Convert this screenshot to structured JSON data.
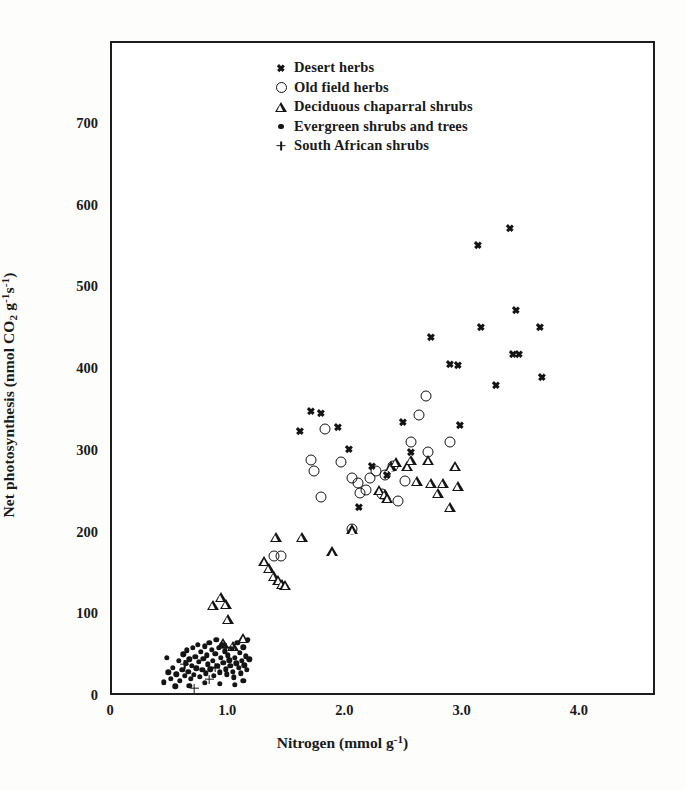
{
  "figure": {
    "background_color": "#fdfdfc",
    "ink_color": "#141414"
  },
  "axes": {
    "x_title_prefix": "Nitrogen (mmol g",
    "x_title_sup": "-1",
    "x_title_suffix": ")",
    "y_title_part1": "Net photosynthesis (nmol CO",
    "y_title_sub": "2",
    "y_title_part2": " g",
    "y_title_sup1": "-1",
    "y_title_part3": "s",
    "y_title_sup2": "-1",
    "y_title_part4": ")",
    "x_ticks": [
      "0",
      "1.0",
      "2.0",
      "3.0",
      "4.0"
    ],
    "x_tick_values": [
      0,
      1.0,
      2.0,
      3.0,
      4.0
    ],
    "y_ticks": [
      "0",
      "100",
      "200",
      "300",
      "400",
      "500",
      "600",
      "700"
    ],
    "y_tick_values": [
      0,
      100,
      200,
      300,
      400,
      500,
      600,
      700
    ]
  },
  "legend": {
    "position": "top-center",
    "entries": [
      {
        "marker": "x-marker",
        "label": "Desert herbs"
      },
      {
        "marker": "circle-marker",
        "label": "Old field herbs"
      },
      {
        "marker": "triangle-marker",
        "label": "Deciduous chaparral shrubs"
      },
      {
        "marker": "dot-marker",
        "label": "Evergreen shrubs and trees"
      },
      {
        "marker": "plus-marker",
        "label": "South African shrubs"
      }
    ]
  },
  "chart_data": {
    "type": "scatter",
    "title": "",
    "xlabel": "Nitrogen (mmol g-1)",
    "ylabel": "Net photosynthesis (nmol CO2 g-1 s-1)",
    "xlim": [
      0,
      4.65
    ],
    "ylim": [
      0,
      800
    ],
    "grid": false,
    "legend_position": "top-center",
    "series": [
      {
        "name": "Desert herbs",
        "marker": "x",
        "points": [
          [
            1.7,
            350
          ],
          [
            1.78,
            348
          ],
          [
            1.93,
            330
          ],
          [
            2.02,
            303
          ],
          [
            2.22,
            283
          ],
          [
            2.11,
            232
          ],
          [
            2.48,
            337
          ],
          [
            2.55,
            300
          ],
          [
            2.72,
            440
          ],
          [
            2.88,
            407
          ],
          [
            2.95,
            406
          ],
          [
            2.97,
            333
          ],
          [
            3.12,
            553
          ],
          [
            3.15,
            453
          ],
          [
            3.4,
            574
          ],
          [
            3.42,
            420
          ],
          [
            3.45,
            474
          ],
          [
            3.47,
            420
          ],
          [
            3.28,
            382
          ],
          [
            3.65,
            452
          ],
          [
            3.67,
            392
          ],
          [
            1.6,
            325
          ],
          [
            2.35,
            272
          ]
        ]
      },
      {
        "name": "Old field herbs",
        "marker": "circle",
        "points": [
          [
            1.44,
            172
          ],
          [
            1.7,
            290
          ],
          [
            1.72,
            277
          ],
          [
            1.78,
            245
          ],
          [
            1.82,
            328
          ],
          [
            1.95,
            287
          ],
          [
            2.05,
            268
          ],
          [
            2.1,
            262
          ],
          [
            2.12,
            250
          ],
          [
            2.17,
            253
          ],
          [
            2.2,
            268
          ],
          [
            2.25,
            276
          ],
          [
            2.33,
            272
          ],
          [
            2.4,
            282
          ],
          [
            2.44,
            240
          ],
          [
            2.5,
            264
          ],
          [
            2.55,
            312
          ],
          [
            2.62,
            345
          ],
          [
            2.68,
            368
          ],
          [
            2.7,
            300
          ],
          [
            2.88,
            312
          ],
          [
            1.38,
            172
          ],
          [
            2.3,
            248
          ],
          [
            2.05,
            205
          ]
        ]
      },
      {
        "name": "Deciduous chaparral shrubs",
        "marker": "triangle",
        "points": [
          [
            0.86,
            113
          ],
          [
            0.93,
            122
          ],
          [
            0.97,
            114
          ],
          [
            0.99,
            95
          ],
          [
            0.95,
            66
          ],
          [
            1.03,
            62
          ],
          [
            1.3,
            166
          ],
          [
            1.34,
            158
          ],
          [
            1.38,
            148
          ],
          [
            1.42,
            143
          ],
          [
            1.45,
            138
          ],
          [
            1.4,
            196
          ],
          [
            1.48,
            137
          ],
          [
            1.62,
            196
          ],
          [
            1.88,
            178
          ],
          [
            2.05,
            205
          ],
          [
            2.28,
            253
          ],
          [
            2.33,
            248
          ],
          [
            2.38,
            282
          ],
          [
            2.42,
            288
          ],
          [
            2.52,
            283
          ],
          [
            2.55,
            290
          ],
          [
            2.6,
            264
          ],
          [
            2.7,
            290
          ],
          [
            2.72,
            262
          ],
          [
            2.78,
            250
          ],
          [
            2.82,
            262
          ],
          [
            2.88,
            232
          ],
          [
            2.93,
            283
          ],
          [
            2.95,
            258
          ],
          [
            2.35,
            243
          ],
          [
            1.12,
            72
          ]
        ]
      },
      {
        "name": "Evergreen shrubs and trees",
        "marker": "dot",
        "points": [
          [
            0.44,
            18
          ],
          [
            0.5,
            22
          ],
          [
            0.52,
            36
          ],
          [
            0.55,
            28
          ],
          [
            0.57,
            44
          ],
          [
            0.58,
            20
          ],
          [
            0.6,
            33
          ],
          [
            0.61,
            52
          ],
          [
            0.62,
            26
          ],
          [
            0.63,
            41
          ],
          [
            0.64,
            57
          ],
          [
            0.65,
            31
          ],
          [
            0.66,
            46
          ],
          [
            0.67,
            22
          ],
          [
            0.68,
            38
          ],
          [
            0.69,
            60
          ],
          [
            0.7,
            27
          ],
          [
            0.71,
            49
          ],
          [
            0.72,
            35
          ],
          [
            0.73,
            64
          ],
          [
            0.74,
            43
          ],
          [
            0.75,
            25
          ],
          [
            0.76,
            55
          ],
          [
            0.77,
            33
          ],
          [
            0.78,
            47
          ],
          [
            0.79,
            62
          ],
          [
            0.8,
            29
          ],
          [
            0.81,
            51
          ],
          [
            0.82,
            40
          ],
          [
            0.83,
            66
          ],
          [
            0.84,
            34
          ],
          [
            0.85,
            58
          ],
          [
            0.86,
            44
          ],
          [
            0.87,
            26
          ],
          [
            0.88,
            53
          ],
          [
            0.89,
            70
          ],
          [
            0.9,
            38
          ],
          [
            0.91,
            60
          ],
          [
            0.92,
            30
          ],
          [
            0.93,
            48
          ],
          [
            0.94,
            64
          ],
          [
            0.95,
            42
          ],
          [
            0.96,
            56
          ],
          [
            0.97,
            34
          ],
          [
            0.98,
            28
          ],
          [
            0.99,
            51
          ],
          [
            1.0,
            45
          ],
          [
            1.01,
            38
          ],
          [
            1.02,
            59
          ],
          [
            1.03,
            31
          ],
          [
            1.04,
            24
          ],
          [
            1.05,
            48
          ],
          [
            1.06,
            41
          ],
          [
            1.07,
            66
          ],
          [
            1.08,
            36
          ],
          [
            1.09,
            54
          ],
          [
            1.1,
            29
          ],
          [
            1.11,
            44
          ],
          [
            1.12,
            61
          ],
          [
            1.13,
            39
          ],
          [
            1.14,
            50
          ],
          [
            1.15,
            33
          ],
          [
            1.16,
            70
          ],
          [
            1.17,
            46
          ],
          [
            0.54,
            13
          ],
          [
            0.66,
            14
          ],
          [
            0.79,
            17
          ],
          [
            0.92,
            16
          ],
          [
            1.05,
            15
          ],
          [
            1.12,
            20
          ],
          [
            0.48,
            30
          ],
          [
            0.47,
            48
          ]
        ]
      },
      {
        "name": "South African shrubs",
        "marker": "plus",
        "points": [
          [
            0.7,
            11
          ],
          [
            0.62,
            40
          ],
          [
            0.88,
            36
          ],
          [
            0.97,
            60
          ],
          [
            0.83,
            22
          ]
        ]
      }
    ]
  }
}
